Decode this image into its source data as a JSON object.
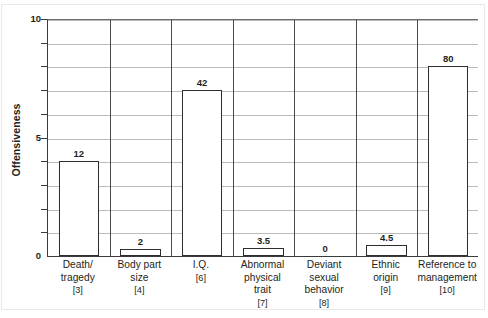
{
  "chart_data": {
    "type": "bar",
    "title": "",
    "subtitle": "",
    "xlabel": "",
    "ylabel": "Offensiveness",
    "ylim": [
      0,
      10
    ],
    "yticks": [
      0,
      5,
      10
    ],
    "ytick_labels": [
      "0",
      "5",
      "10"
    ],
    "gridlines": [
      1,
      2,
      3,
      4,
      5,
      6,
      7,
      8,
      9,
      10
    ],
    "grid": true,
    "legend": "none",
    "categories": [
      "Death/ tragedy",
      "Body part size",
      "I.Q.",
      "Abnormal physical trait",
      "Deviant sexual behavior",
      "Ethnic origin",
      "Reference to management"
    ],
    "category_lines": [
      [
        "Death/",
        "tragedy"
      ],
      [
        "Body part",
        "size"
      ],
      [
        "I.Q."
      ],
      [
        "Abnormal",
        "physical",
        "trait"
      ],
      [
        "Deviant",
        "sexual",
        "behavior"
      ],
      [
        "Ethnic",
        "origin"
      ],
      [
        "Reference to",
        "management"
      ]
    ],
    "category_refs": [
      "[3]",
      "[4]",
      "[6]",
      "[7]",
      "[8]",
      "[9]",
      "[10]"
    ],
    "data_labels": [
      "12",
      "2",
      "42",
      "3.5",
      "0",
      "4.5",
      "80"
    ],
    "values": [
      4.0,
      0.3,
      7.0,
      0.35,
      0,
      0.45,
      8.0
    ],
    "colors": {
      "bar_fill": "#ffffff",
      "bar_stroke": "#2d2d2f",
      "gridline": "#bcbcbe",
      "axis": "#3b3b3d",
      "text": "#231f20",
      "background": "#ffffff"
    }
  }
}
